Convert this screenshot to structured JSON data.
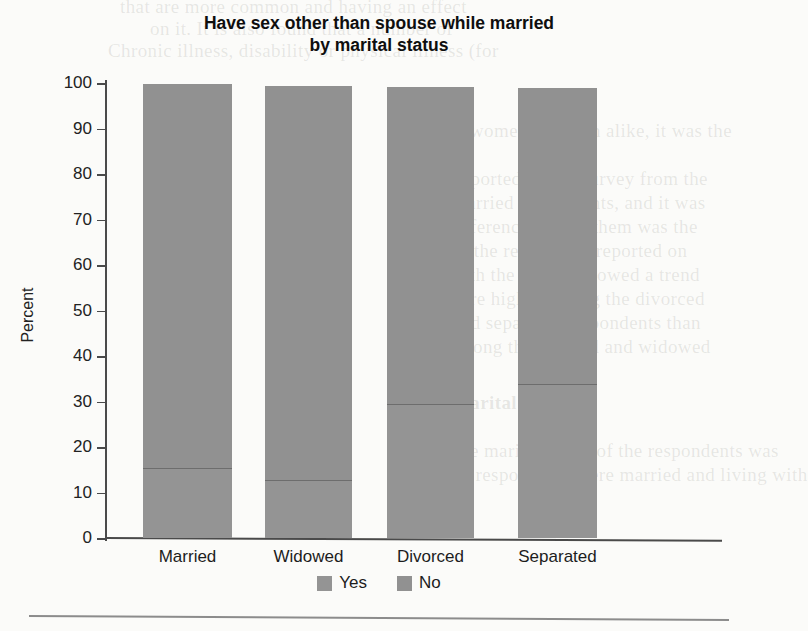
{
  "chart_data": {
    "type": "bar",
    "subtype": "stacked-100",
    "title": "Have sex other than spouse while married by marital status",
    "title_lines": [
      "Have sex other than spouse while married",
      "by marital status"
    ],
    "xlabel": "",
    "ylabel": "Percent",
    "ylim": [
      0,
      100
    ],
    "yticks": [
      0,
      10,
      20,
      30,
      40,
      50,
      60,
      70,
      80,
      90,
      100
    ],
    "ytick_labels": [
      "0",
      "10",
      "20",
      "30",
      "40",
      "50",
      "60",
      "70",
      "80",
      "90",
      "100"
    ],
    "grid": false,
    "legend_position": "bottom-center",
    "categories": [
      "Married",
      "Widowed",
      "Divorced",
      "Separated"
    ],
    "series": [
      {
        "name": "Yes",
        "color": "#949494",
        "values": [
          15.2,
          12.5,
          29.3,
          33.6
        ]
      },
      {
        "name": "No",
        "color": "#919191",
        "values": [
          84.5,
          86.9,
          69.9,
          65.4
        ]
      }
    ],
    "bar_totals": [
      99.7,
      99.4,
      99.2,
      99.0
    ]
  },
  "legend": {
    "items": [
      {
        "label": "Yes",
        "color": "#949494"
      },
      {
        "label": "No",
        "color": "#919191"
      }
    ]
  },
  "background_bleed": [
    "that are more common and having an effect",
    "on it. It is also found that a number of",
    "Chronic illness, disability or physical illness (for",
    "women and men alike, it was the",
    "reported in this survey from the",
    "married respondents, and it was",
    "difference among them was the",
    "of the respondent reported on",
    "both the groups showed a trend",
    "were higher among the divorced",
    "and separated respondents than",
    "among the married and widowed",
    "Marital status",
    "The marital status of the respondents was",
    "the respondents were married and living with"
  ]
}
